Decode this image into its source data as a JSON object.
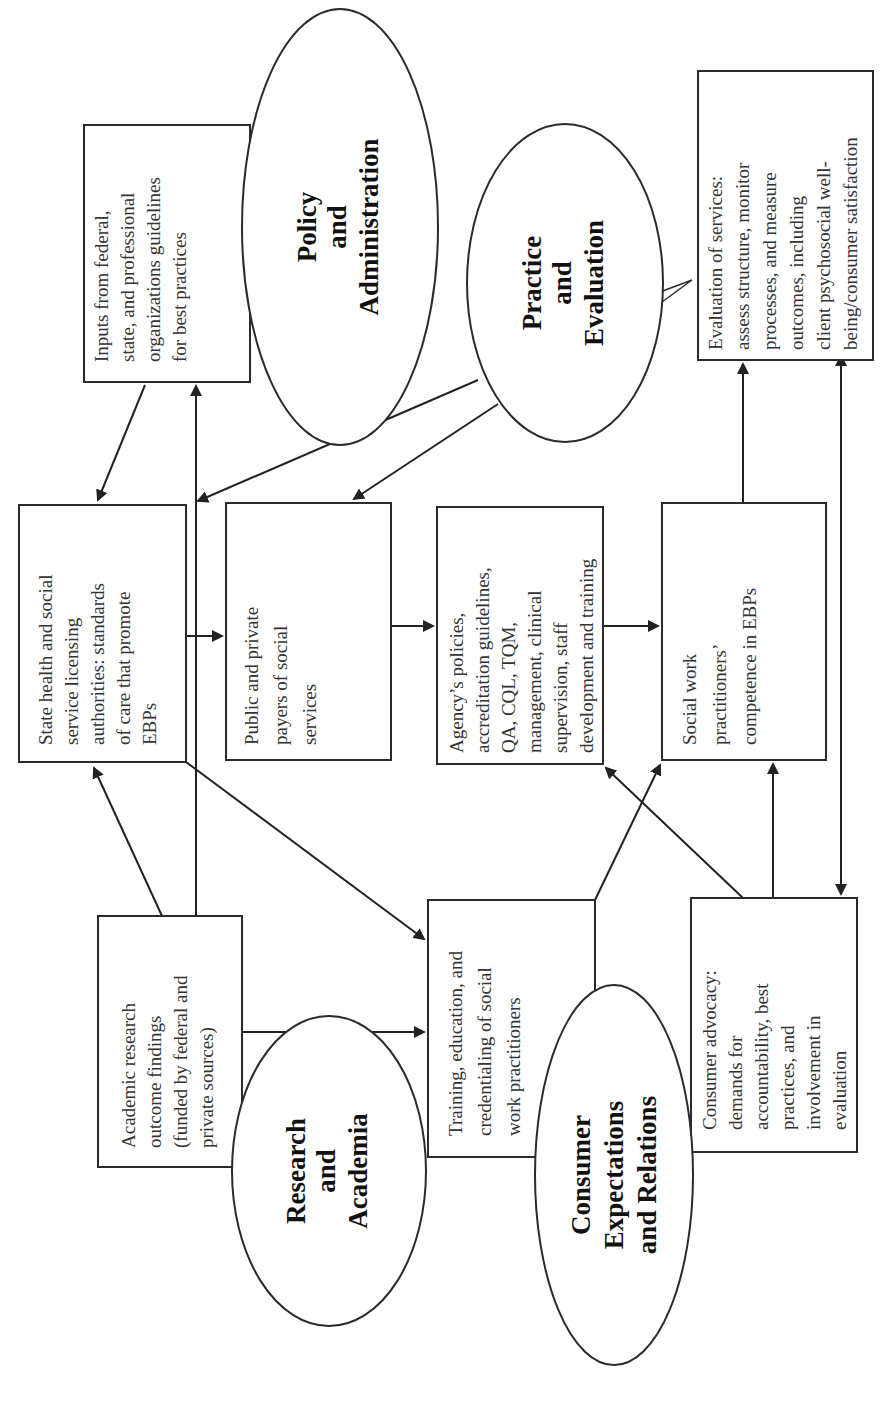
{
  "diagram": {
    "orientation": "rotated-90-counterclockwise",
    "ellipses": [
      {
        "id": "policy",
        "lines": [
          "Policy",
          "and",
          "Administration"
        ]
      },
      {
        "id": "practice",
        "lines": [
          "Practice",
          "and",
          "Evaluation"
        ]
      },
      {
        "id": "research",
        "lines": [
          "Research",
          "and",
          "Academia"
        ]
      },
      {
        "id": "consumer",
        "lines": [
          "Consumer",
          "Expectations",
          "and Relations"
        ]
      }
    ],
    "boxes": [
      {
        "id": "inputs",
        "lines": [
          "Inputs from federal,",
          "state, and professional",
          "organizations guidelines",
          "for best practices"
        ]
      },
      {
        "id": "state_health",
        "lines": [
          "State health and social",
          "service licensing",
          "authorities: standards",
          "of care that promote",
          "EBPs"
        ]
      },
      {
        "id": "payers",
        "lines": [
          "Public and private",
          "payers of social",
          "services"
        ]
      },
      {
        "id": "agency",
        "lines": [
          "Agency’s policies,",
          "accreditation guidelines,",
          "QA, CQL, TQM,",
          "management, clinical",
          "supervision, staff",
          "development and training"
        ]
      },
      {
        "id": "competence",
        "lines": [
          "Social work",
          "practitioners’",
          "competence in EBPs"
        ]
      },
      {
        "id": "evaluation",
        "lines": [
          "Evaluation of services:",
          "assess structure, monitor",
          "processes, and measure",
          "outcomes, including",
          "client psychosocial well-",
          "being/consumer satisfaction"
        ]
      },
      {
        "id": "academic",
        "lines": [
          "Academic research",
          "outcome findings",
          "(funded by federal and",
          "private sources)"
        ]
      },
      {
        "id": "training",
        "lines": [
          "Training, education, and",
          "credentialing of social",
          "work practitioners"
        ]
      },
      {
        "id": "advocacy",
        "lines": [
          "Consumer advocacy:",
          "demands for",
          "accountability, best",
          "practices, and",
          "involvement in",
          "evaluation"
        ]
      }
    ]
  }
}
